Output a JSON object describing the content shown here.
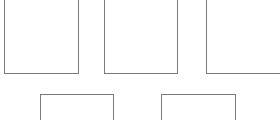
{
  "canvas": {
    "width": 280,
    "height": 120,
    "background": "#ffffff"
  },
  "style": {
    "stroke_color": "#7a7a7a",
    "stroke_width": 1
  },
  "boxes": [
    {
      "id": "box-1",
      "row": 1,
      "x": 4,
      "y": -2,
      "width": 75,
      "height": 76
    },
    {
      "id": "box-2",
      "row": 1,
      "x": 104,
      "y": -2,
      "width": 74,
      "height": 76
    },
    {
      "id": "box-3",
      "row": 1,
      "x": 206,
      "y": -2,
      "width": 76,
      "height": 76
    },
    {
      "id": "box-4",
      "row": 2,
      "x": 40,
      "y": 94,
      "width": 74,
      "height": 30
    },
    {
      "id": "box-5",
      "row": 2,
      "x": 161,
      "y": 94,
      "width": 75,
      "height": 30
    }
  ]
}
